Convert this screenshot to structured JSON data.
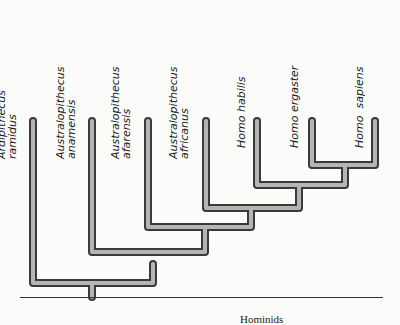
{
  "diagram": {
    "type": "cladogram",
    "axis_label": "Hominids",
    "taxa": [
      {
        "line1": "Ardipithecus",
        "line2": "ramidus"
      },
      {
        "line1": "Australopithecus",
        "line2": "anamensis"
      },
      {
        "line1": "Australopithecus",
        "line2": "afarensis"
      },
      {
        "line1": "Australopithecus",
        "line2": "africanus"
      },
      {
        "line1": "Homo habilis",
        "line2": ""
      },
      {
        "line1": "Homo ergaster",
        "line2": ""
      },
      {
        "line1": "Homo  sapiens",
        "line2": ""
      }
    ],
    "tree": "(Ardipithecus ramidus,(Australopithecus anamensis,(Australopithecus afarensis,(Australopithecus africanus,(Homo habilis,(Homo ergaster,Homo sapiens))))))",
    "colors": {
      "branch": "#8c8c8c",
      "branch_edge": "#3a3a3a",
      "text": "#1a1a1a"
    }
  }
}
